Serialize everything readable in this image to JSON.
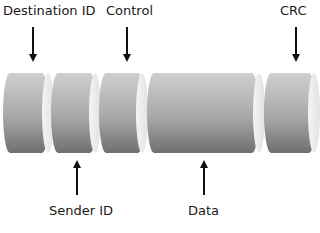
{
  "diagram": {
    "top_labels": [
      {
        "text": "Destination ID"
      },
      {
        "text": "Control"
      },
      {
        "text": "CRC"
      }
    ],
    "bottom_labels": [
      {
        "text": "Sender ID"
      },
      {
        "text": "Data"
      }
    ],
    "segments": [
      {
        "name": "Destination ID"
      },
      {
        "name": "Sender ID"
      },
      {
        "name": "Control"
      },
      {
        "name": "Data"
      },
      {
        "name": "CRC"
      }
    ]
  }
}
